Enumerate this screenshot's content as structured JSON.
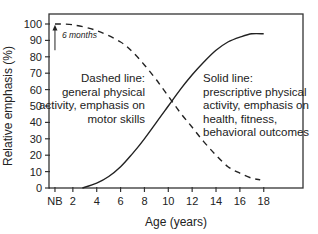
{
  "chart_data": {
    "type": "line",
    "title": "",
    "xlabel": "Age (years)",
    "ylabel": "Relative emphasis (%)",
    "xlim": [
      0,
      21.2
    ],
    "ylim": [
      0,
      106
    ],
    "x_ticks": [
      0.5,
      2,
      4,
      6,
      8,
      10,
      12,
      14,
      16,
      18
    ],
    "x_tick_labels": [
      "NB",
      "2",
      "4",
      "6",
      "8",
      "10",
      "12",
      "14",
      "16",
      "18"
    ],
    "y_ticks": [
      0,
      10,
      20,
      30,
      40,
      50,
      60,
      70,
      80,
      90,
      100
    ],
    "y_tick_labels": [
      "0",
      "10",
      "20",
      "30",
      "40",
      "50",
      "60",
      "70",
      "80",
      "90",
      "100"
    ],
    "grid": false,
    "series": [
      {
        "name": "Dashed line: general physical activity, emphasis on motor skills",
        "style": "dashed",
        "x": [
          0.5,
          2,
          4,
          6,
          7,
          8,
          9,
          10,
          11,
          12,
          13,
          14,
          15,
          16,
          17,
          17.7
        ],
        "y": [
          100,
          99.5,
          96,
          89,
          83,
          75,
          66,
          56,
          46,
          37,
          28,
          20,
          13,
          9,
          6,
          5
        ]
      },
      {
        "name": "Solid line: prescriptive physical activity, emphasis on health, fitness, behavioral outcomes",
        "style": "solid",
        "x": [
          2.8,
          4,
          5,
          6,
          7,
          8,
          9,
          10,
          11,
          12,
          13,
          14,
          15,
          16,
          17,
          18
        ],
        "y": [
          0,
          3,
          7,
          13,
          21,
          30,
          40,
          50,
          60,
          69,
          77,
          84,
          89,
          92,
          94,
          94
        ]
      }
    ],
    "annotations": [
      {
        "text": "6 months",
        "x": 0.5,
        "y": 93,
        "arrow": "up"
      },
      {
        "text": "Dashed line:|general physical|activity, emphasis on|motor skills",
        "x": 7.6,
        "y": 60
      },
      {
        "text": "Solid line:|prescriptive physical|activity, emphasis on|health, fitness,|behavioral outcomes",
        "x": 10.8,
        "y": 60
      }
    ]
  },
  "labels": {
    "annotation_6months": "6 months",
    "dashed_label": [
      "Dashed line:",
      "general physical",
      "activity, emphasis on",
      "motor skills"
    ],
    "solid_label": [
      "Solid line:",
      "prescriptive physical",
      "activity, emphasis on",
      "health, fitness,",
      "behavioral outcomes"
    ]
  },
  "colors": {
    "line": "#222222",
    "frame": "#333333",
    "text": "#222222"
  }
}
